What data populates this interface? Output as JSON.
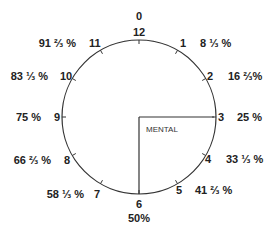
{
  "diagram": {
    "type": "clock-face",
    "center_label": "MENTAL",
    "colors": {
      "line": "#333333",
      "text": "#222222",
      "background": "#ffffff"
    },
    "top_extra_label": "0",
    "bottom_extra_label": "50%",
    "hours": [
      {
        "hour": "12",
        "percent": ""
      },
      {
        "hour": "1",
        "percent": "8 ⅓ %"
      },
      {
        "hour": "2",
        "percent": "16 ⅔%"
      },
      {
        "hour": "3",
        "percent": "25 %"
      },
      {
        "hour": "4",
        "percent": "33 ⅓ %"
      },
      {
        "hour": "5",
        "percent": "41 ⅔ %"
      },
      {
        "hour": "6",
        "percent": ""
      },
      {
        "hour": "7",
        "percent": "58 ⅓ %"
      },
      {
        "hour": "8",
        "percent": "66 ⅔ %"
      },
      {
        "hour": "9",
        "percent": "75 %"
      },
      {
        "hour": "10",
        "percent": "83 ⅓ %"
      },
      {
        "hour": "11",
        "percent": "91 ⅔ %"
      }
    ],
    "hands": {
      "hour_hand_points_to": "3",
      "minute_hand_points_to": "6"
    }
  }
}
